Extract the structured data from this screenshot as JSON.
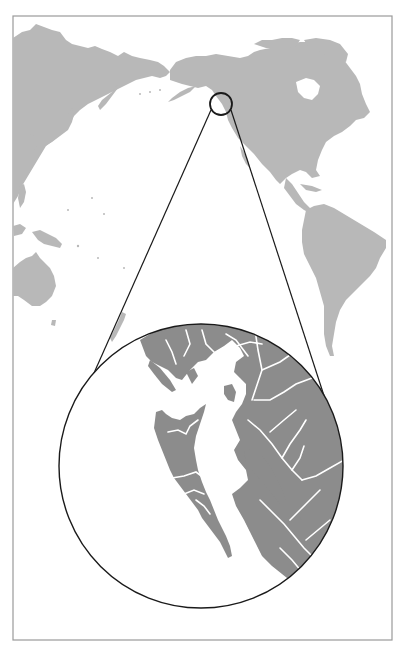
{
  "figure": {
    "type": "locator-map",
    "frame": {
      "x": 13,
      "y": 16,
      "width": 379,
      "height": 624,
      "stroke": "#9a9a9a"
    },
    "colors": {
      "background": "#ffffff",
      "world_land": "#b8b8b8",
      "inset_land": "#8c8c8c",
      "inset_water_lines": "#ffffff",
      "callout_lines": "#1a1a1a"
    },
    "locator_circle": {
      "cx": 221,
      "cy": 104,
      "r": 11,
      "region": "Southeast Alaska / British Columbia coast"
    },
    "inset_circle": {
      "cx": 201,
      "cy": 466,
      "r": 142,
      "region": "Haida Gwaii and northern British Columbia coast"
    },
    "callout_lines": [
      {
        "from": [
          211,
          110
        ],
        "to": [
          82,
          400
        ]
      },
      {
        "from": [
          231,
          110
        ],
        "to": [
          329,
          411
        ]
      }
    ],
    "landmasses": [
      "Asia",
      "North America",
      "South America",
      "Australia",
      "New Zealand",
      "Papua New Guinea",
      "Japan",
      "Kamchatka",
      "Alaska",
      "Greenland (partial)",
      "Haida Gwaii",
      "Alexander Archipelago",
      "British Columbia mainland"
    ]
  }
}
